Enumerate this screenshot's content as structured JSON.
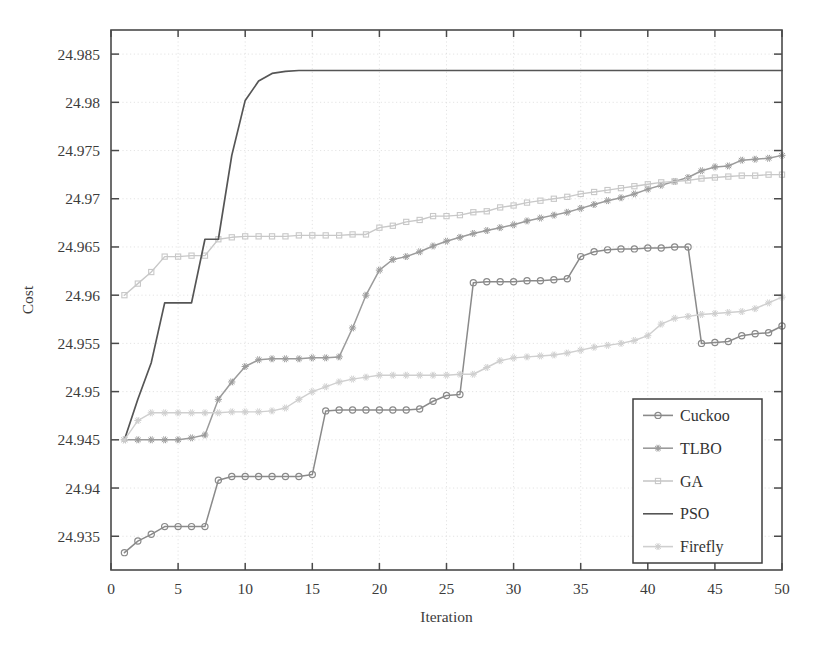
{
  "chart_data": {
    "type": "line",
    "title": "",
    "xlabel": "Iteration",
    "ylabel": "Cost",
    "xlim": [
      0,
      50
    ],
    "ylim": [
      24.9315,
      24.9875
    ],
    "xticks": [
      0,
      5,
      10,
      15,
      20,
      25,
      30,
      35,
      40,
      45,
      50
    ],
    "yticks": [
      24.935,
      24.94,
      24.945,
      24.95,
      24.955,
      24.96,
      24.965,
      24.97,
      24.975,
      24.98,
      24.985
    ],
    "xticklabels": [
      "0",
      "5",
      "10",
      "15",
      "20",
      "25",
      "30",
      "35",
      "40",
      "45",
      "50"
    ],
    "yticklabels": [
      "24.935",
      "24.94",
      "24.945",
      "24.95",
      "24.955",
      "24.96",
      "24.965",
      "24.97",
      "24.975",
      "24.98",
      "24.985"
    ],
    "grid": true,
    "legend_position": "lower-right",
    "x": [
      1,
      2,
      3,
      4,
      5,
      6,
      7,
      8,
      9,
      10,
      11,
      12,
      13,
      14,
      15,
      16,
      17,
      18,
      19,
      20,
      21,
      22,
      23,
      24,
      25,
      26,
      27,
      28,
      29,
      30,
      31,
      32,
      33,
      34,
      35,
      36,
      37,
      38,
      39,
      40,
      41,
      42,
      43,
      44,
      45,
      46,
      47,
      48,
      49,
      50
    ],
    "series": [
      {
        "name": "Cuckoo",
        "color": "#8a8a8a",
        "marker": "circle",
        "linewidth": 1.5,
        "values": [
          24.9333,
          24.9345,
          24.9352,
          24.936,
          24.936,
          24.936,
          24.936,
          24.9408,
          24.9412,
          24.9412,
          24.9412,
          24.9412,
          24.9412,
          24.9412,
          24.9414,
          24.948,
          24.9481,
          24.9481,
          24.9481,
          24.9481,
          24.9481,
          24.9481,
          24.9482,
          24.949,
          24.9496,
          24.9497,
          24.9613,
          24.9614,
          24.9614,
          24.9614,
          24.9615,
          24.9615,
          24.9616,
          24.9617,
          24.964,
          24.9645,
          24.9647,
          24.9648,
          24.9648,
          24.9649,
          24.9649,
          24.965,
          24.965,
          24.955,
          24.9551,
          24.9552,
          24.9558,
          24.956,
          24.9561,
          24.9568
        ]
      },
      {
        "name": "TLBO",
        "color": "#9b9b9b",
        "marker": "star",
        "linewidth": 1.5,
        "values": [
          24.945,
          24.945,
          24.945,
          24.945,
          24.945,
          24.9452,
          24.9455,
          24.9492,
          24.951,
          24.9526,
          24.9533,
          24.9534,
          24.9534,
          24.9534,
          24.9535,
          24.9535,
          24.9536,
          24.9566,
          24.96,
          24.9626,
          24.9637,
          24.964,
          24.9645,
          24.9651,
          24.9656,
          24.966,
          24.9664,
          24.9667,
          24.967,
          24.9673,
          24.9677,
          24.968,
          24.9683,
          24.9686,
          24.969,
          24.9694,
          24.9698,
          24.9701,
          24.9705,
          24.971,
          24.9714,
          24.9718,
          24.9722,
          24.9729,
          24.9733,
          24.9734,
          24.974,
          24.9741,
          24.9742,
          24.9745
        ]
      },
      {
        "name": "GA",
        "color": "#c8c8c8",
        "marker": "square",
        "linewidth": 1.4,
        "values": [
          24.96,
          24.9612,
          24.9624,
          24.964,
          24.964,
          24.9641,
          24.9641,
          24.9658,
          24.966,
          24.9661,
          24.9661,
          24.9661,
          24.9661,
          24.9662,
          24.9662,
          24.9662,
          24.9662,
          24.9663,
          24.9663,
          24.967,
          24.9672,
          24.9676,
          24.9678,
          24.9682,
          24.9682,
          24.9683,
          24.9686,
          24.9687,
          24.9691,
          24.9693,
          24.9696,
          24.9698,
          24.97,
          24.9702,
          24.9705,
          24.9707,
          24.9709,
          24.9711,
          24.9713,
          24.9715,
          24.9717,
          24.9718,
          24.9719,
          24.9721,
          24.9722,
          24.9723,
          24.9724,
          24.9724,
          24.9725,
          24.9725
        ]
      },
      {
        "name": "PSO",
        "color": "#555555",
        "marker": "none",
        "linewidth": 1.7,
        "values": [
          24.945,
          24.9492,
          24.953,
          24.9592,
          24.9592,
          24.9592,
          24.9658,
          24.9658,
          24.9745,
          24.9802,
          24.9822,
          24.983,
          24.9832,
          24.9833,
          24.9833,
          24.9833,
          24.9833,
          24.9833,
          24.9833,
          24.9833,
          24.9833,
          24.9833,
          24.9833,
          24.9833,
          24.9833,
          24.9833,
          24.9833,
          24.9833,
          24.9833,
          24.9833,
          24.9833,
          24.9833,
          24.9833,
          24.9833,
          24.9833,
          24.9833,
          24.9833,
          24.9833,
          24.9833,
          24.9833,
          24.9833,
          24.9833,
          24.9833,
          24.9833,
          24.9833,
          24.9833,
          24.9833,
          24.9833,
          24.9833,
          24.9833
        ]
      },
      {
        "name": "Firefly",
        "color": "#cfcfcf",
        "marker": "star",
        "linewidth": 1.4,
        "values": [
          24.945,
          24.947,
          24.9478,
          24.9478,
          24.9478,
          24.9478,
          24.9478,
          24.9478,
          24.9479,
          24.9479,
          24.9479,
          24.948,
          24.9483,
          24.9492,
          24.95,
          24.9505,
          24.951,
          24.9513,
          24.9515,
          24.9517,
          24.9517,
          24.9517,
          24.9517,
          24.9517,
          24.9517,
          24.9518,
          24.9518,
          24.9525,
          24.9532,
          24.9535,
          24.9536,
          24.9537,
          24.9538,
          24.954,
          24.9543,
          24.9546,
          24.9548,
          24.955,
          24.9553,
          24.9558,
          24.957,
          24.9576,
          24.9578,
          24.958,
          24.9581,
          24.9582,
          24.9583,
          24.9586,
          24.9592,
          24.9598
        ]
      }
    ],
    "legend": [
      {
        "label": "Cuckoo",
        "color": "#8a8a8a",
        "marker": "circle"
      },
      {
        "label": "TLBO",
        "color": "#9b9b9b",
        "marker": "star"
      },
      {
        "label": "GA",
        "color": "#c8c8c8",
        "marker": "square"
      },
      {
        "label": "PSO",
        "color": "#555555",
        "marker": "none"
      },
      {
        "label": "Firefly",
        "color": "#cfcfcf",
        "marker": "star"
      }
    ]
  }
}
